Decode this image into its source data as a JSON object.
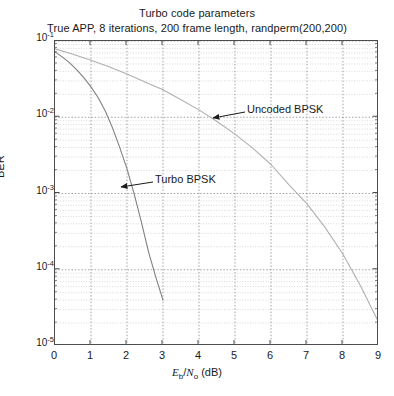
{
  "chart_data": {
    "type": "line",
    "title": "Turbo code parameters",
    "subtitle": "True APP, 8 iterations, 200 frame length, randperm(200,200)",
    "xlabel": "E_b/N_o (dB)",
    "xlabel_parts": {
      "e": "E",
      "b": "b",
      "slash": "/",
      "n": "N",
      "o": "o",
      "unit": " (dB)"
    },
    "ylabel": "BER",
    "xlim": [
      0,
      9
    ],
    "ylim": [
      1e-05,
      0.1
    ],
    "yscale": "log",
    "xscale": "linear",
    "grid": true,
    "grid_minor": true,
    "legend": "none",
    "xticks": [
      "0",
      "1",
      "2",
      "3",
      "4",
      "5",
      "6",
      "7",
      "8",
      "9"
    ],
    "xtick_values": [
      0,
      1,
      2,
      3,
      4,
      5,
      6,
      7,
      8,
      9
    ],
    "yticks": [
      "10-1",
      "10-2",
      "10-3",
      "10-4",
      "10-5"
    ],
    "ytick_values": [
      0.1,
      0.01,
      0.001,
      0.0001,
      1e-05
    ],
    "ytick_mantissa": [
      "10",
      "10",
      "10",
      "10",
      "10"
    ],
    "ytick_exponent": [
      "-1",
      "-2",
      "-3",
      "-4",
      "-5"
    ],
    "series": [
      {
        "name": "Turbo BPSK",
        "color": "#808080",
        "x": [
          0,
          0.2,
          0.4,
          0.6,
          0.8,
          1.0,
          1.2,
          1.4,
          1.6,
          1.8,
          2.0,
          2.2,
          2.4,
          2.6,
          2.8,
          3.0
        ],
        "values": [
          0.072,
          0.062,
          0.052,
          0.042,
          0.033,
          0.025,
          0.018,
          0.012,
          0.0072,
          0.004,
          0.0021,
          0.00098,
          0.00042,
          0.00017,
          8e-05,
          4e-05
        ]
      },
      {
        "name": "Uncoded BPSK",
        "color": "#b0b0b0",
        "x": [
          0,
          0.5,
          1.0,
          1.5,
          2.0,
          2.5,
          3.0,
          3.5,
          4.0,
          4.5,
          5.0,
          5.5,
          6.0,
          6.5,
          7.0,
          7.5,
          8.0,
          8.5,
          9.0
        ],
        "values": [
          0.079,
          0.067,
          0.056,
          0.046,
          0.037,
          0.029,
          0.023,
          0.017,
          0.0125,
          0.0088,
          0.006,
          0.0039,
          0.0024,
          0.0013,
          0.00073,
          0.00036,
          0.00016,
          6e-05,
          2e-05
        ]
      }
    ],
    "annotations": [
      {
        "text": "Uncoded BPSK",
        "label_x": 247,
        "label_y": 104,
        "arrow_from_x": 245,
        "arrow_from_y": 112,
        "arrow_to_x": 213,
        "arrow_to_y": 118
      },
      {
        "text": "Turbo BPSK",
        "label_x": 155,
        "label_y": 174,
        "arrow_from_x": 153,
        "arrow_from_y": 182,
        "arrow_to_x": 121,
        "arrow_to_y": 187
      }
    ]
  },
  "colors": {
    "axis": "#4d4d4d",
    "grid_major": "#8c8c8c",
    "grid_minor": "#c8c8c8",
    "text": "#1a1a1a"
  }
}
